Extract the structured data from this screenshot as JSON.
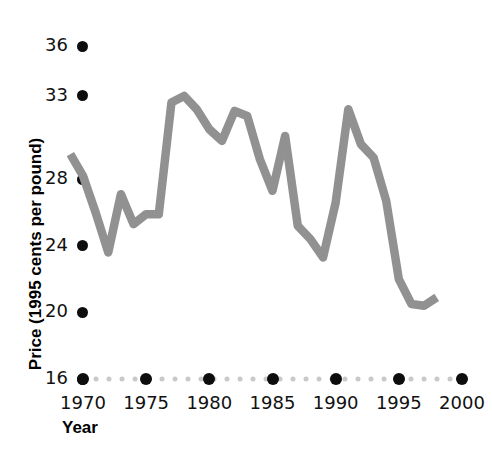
{
  "chart_data": {
    "type": "line",
    "title": "",
    "xlabel": "Year",
    "ylabel": "Price (1995 cents per pound)",
    "xlim": [
      1969,
      2000
    ],
    "ylim": [
      16,
      36
    ],
    "grid": false,
    "legend": "none",
    "line_color": "#919191",
    "tick_color": "#0d0d0d",
    "axis_dot_color": "#c9c9c9",
    "x_ticks": [
      "1970",
      "1975",
      "1980",
      "1985",
      "1990",
      "1995",
      "2000"
    ],
    "x_tick_values": [
      1970,
      1975,
      1980,
      1985,
      1990,
      1995,
      2000
    ],
    "y_ticks": [
      "36",
      "33",
      "28",
      "24",
      "20",
      "16"
    ],
    "y_tick_values": [
      36,
      33,
      28,
      24,
      20,
      16
    ],
    "series": [
      {
        "name": "Price (1995 cents per pound)",
        "x": [
          1969,
          1970,
          1971,
          1972,
          1973,
          1974,
          1975,
          1976,
          1977,
          1978,
          1979,
          1980,
          1981,
          1982,
          1983,
          1984,
          1985,
          1986,
          1987,
          1988,
          1989,
          1990,
          1991,
          1992,
          1993,
          1994,
          1995,
          1996,
          1997,
          1998
        ],
        "values": [
          29.5,
          28.2,
          26.0,
          23.6,
          27.1,
          25.3,
          25.9,
          25.9,
          32.6,
          33.0,
          32.2,
          31.0,
          30.3,
          32.1,
          31.8,
          29.2,
          27.3,
          30.6,
          25.2,
          24.4,
          23.3,
          26.6,
          32.2,
          30.1,
          29.3,
          26.7,
          22.0,
          20.5,
          20.4,
          20.9
        ]
      }
    ]
  }
}
